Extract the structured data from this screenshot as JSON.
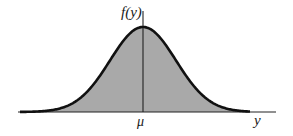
{
  "chart_data": {
    "type": "area",
    "title": "",
    "xlabel": "y",
    "ylabel": "f(y)",
    "x_ticks": [
      "μ"
    ],
    "grid": false,
    "legend": null,
    "series": [
      {
        "name": "f(y)",
        "distribution": "normal",
        "mean_label": "μ",
        "x": [
          -3,
          -2.5,
          -2,
          -1.5,
          -1,
          -0.5,
          0,
          0.5,
          1,
          1.5,
          2,
          2.5,
          3
        ],
        "values": [
          0.011,
          0.044,
          0.135,
          0.325,
          0.607,
          0.882,
          1.0,
          0.882,
          0.607,
          0.325,
          0.135,
          0.044,
          0.011
        ]
      }
    ]
  },
  "labels": {
    "y_axis": "f(y)",
    "x_axis": "y",
    "mean": "μ"
  },
  "colors": {
    "fill": "#a9a9a9",
    "curve": "#111111",
    "axis": "#222222",
    "background": "#ffffff"
  }
}
